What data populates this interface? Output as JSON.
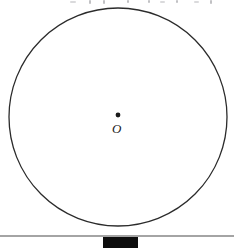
{
  "figure": {
    "type": "geometry-diagram",
    "width": 234,
    "height": 249,
    "background_color": "#ffffff"
  },
  "circle": {
    "name": "circle",
    "center_x": 118,
    "center_y": 117,
    "radius": 109,
    "stroke_color": "#2b2b2b",
    "stroke_width": 1.3,
    "fill": "none"
  },
  "center_point": {
    "name": "center-dot",
    "x": 118,
    "y": 115,
    "radius": 2.4,
    "color": "#1a1a1a"
  },
  "center_label": {
    "text": "O",
    "x": 112,
    "y": 122,
    "color": "#1b1b1b",
    "font_size_px": 13,
    "italic": true
  },
  "ground_line": {
    "name": "ground-line",
    "x1": 0,
    "y1": 236,
    "x2": 234,
    "y2": 236,
    "stroke_color": "#4a4a4a",
    "stroke_width": 1.2
  },
  "block": {
    "name": "block",
    "x": 103,
    "y": 237,
    "width": 35,
    "height": 11,
    "fill_color": "#0d0d0d"
  },
  "top_artifacts": {
    "note": "faint descender fragments of cut-off text along the top edge",
    "color": "#a9a9ad",
    "marks": [
      {
        "x": 89,
        "y": 0,
        "width": 2,
        "height": 4
      },
      {
        "x": 103,
        "y": 0,
        "width": 2,
        "height": 4
      },
      {
        "x": 127,
        "y": 0,
        "width": 2,
        "height": 3
      },
      {
        "x": 148,
        "y": 0,
        "width": 2,
        "height": 3
      },
      {
        "x": 176,
        "y": 0,
        "width": 2,
        "height": 3
      },
      {
        "x": 210,
        "y": 0,
        "width": 2,
        "height": 4
      },
      {
        "x": 70,
        "y": 1,
        "width": 6,
        "height": 2
      },
      {
        "x": 160,
        "y": 1,
        "width": 5,
        "height": 2
      },
      {
        "x": 194,
        "y": 1,
        "width": 5,
        "height": 2
      }
    ]
  }
}
